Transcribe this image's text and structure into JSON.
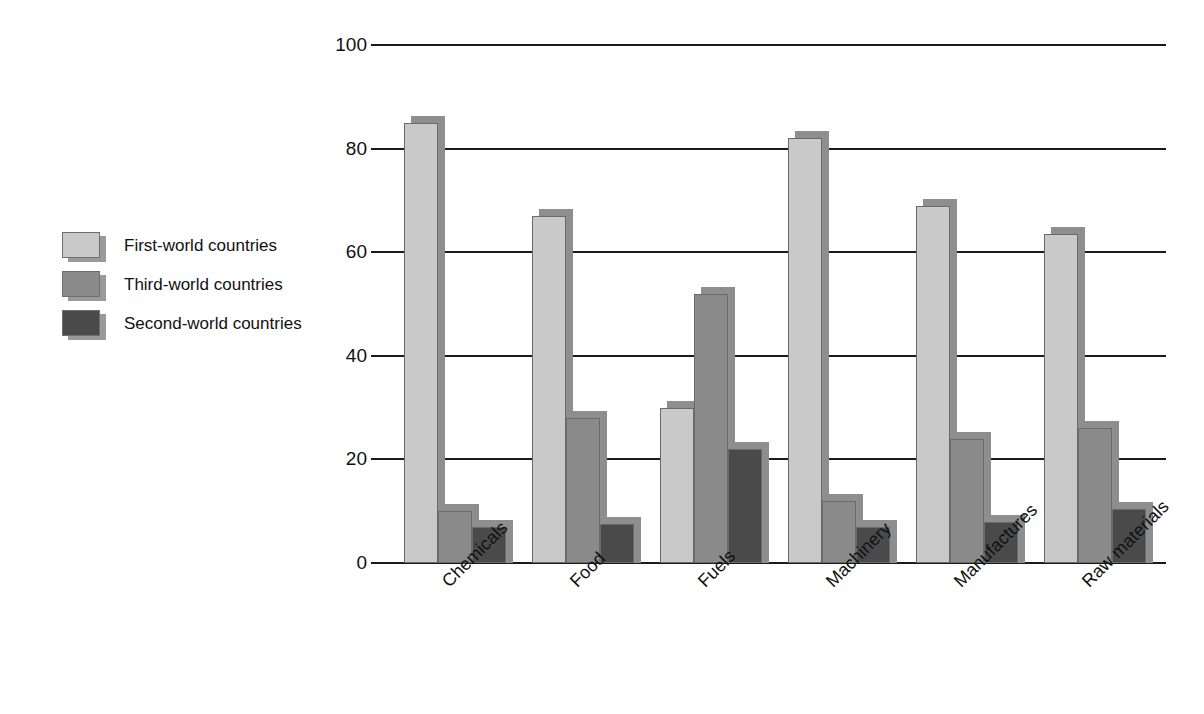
{
  "chart_data": {
    "type": "bar",
    "title": "",
    "subtitle": "",
    "xlabel": "",
    "ylabel": "",
    "ylim": [
      0,
      100
    ],
    "yticks": [
      0,
      20,
      40,
      60,
      80,
      100
    ],
    "grid": true,
    "grid_axis": "y",
    "legend_position": "left-outside",
    "orientation": "vertical",
    "grouping": "grouped",
    "categories": [
      "Chemicals",
      "Food",
      "Fuels",
      "Machinery",
      "Manufactures",
      "Raw materials"
    ],
    "series": [
      {
        "name": "First-world countries",
        "color": "#c9c9c9",
        "values": [
          85,
          67,
          30,
          82,
          69,
          63.5
        ]
      },
      {
        "name": "Third-world countries",
        "color": "#8a8a8a",
        "values": [
          10,
          28,
          52,
          12,
          24,
          26
        ]
      },
      {
        "name": "Second-world countries",
        "color": "#4a4a4a",
        "values": [
          7,
          7.5,
          22,
          7,
          8,
          10.5
        ]
      }
    ]
  },
  "legend": {
    "items": [
      {
        "label": "First-world countries",
        "color": "#c9c9c9"
      },
      {
        "label": "Third-world countries",
        "color": "#8a8a8a"
      },
      {
        "label": "Second-world countries",
        "color": "#4a4a4a"
      }
    ]
  },
  "axis": {
    "y_tick_labels": [
      "100",
      "80",
      "60",
      "40",
      "20",
      "0"
    ],
    "x_tick_labels": [
      "Chemicals",
      "Food",
      "Fuels",
      "Machinery",
      "Manufactures",
      "Raw materials"
    ]
  },
  "colors": {
    "series_light": "#c9c9c9",
    "series_medium": "#8a8a8a",
    "series_dark": "#4a4a4a",
    "shadow": "#8e8e8e",
    "axis": "#1a1a1a",
    "background": "#ffffff"
  }
}
